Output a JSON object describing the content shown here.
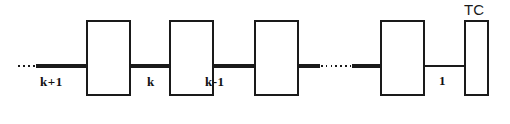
{
  "figure": {
    "type": "chain-block-diagram",
    "width": 510,
    "height": 124,
    "background": "#ffffff",
    "stroke_color": "#1a1a1a",
    "labels": {
      "k_plus_1": "k+1",
      "k": "k",
      "k_minus_1": "k-1",
      "one": "1",
      "tc": "TC"
    },
    "blocks": [
      {
        "id": "block-k-plus-1",
        "x": 87,
        "y": 21,
        "width": 43,
        "height": 74
      },
      {
        "id": "block-k",
        "x": 170,
        "y": 21,
        "width": 43,
        "height": 74
      },
      {
        "id": "block-k-minus-1",
        "x": 255,
        "y": 21,
        "width": 43,
        "height": 74
      },
      {
        "id": "block-one",
        "x": 381,
        "y": 21,
        "width": 43,
        "height": 74
      },
      {
        "id": "block-tc",
        "x": 465,
        "y": 21,
        "width": 23,
        "height": 74
      }
    ],
    "connectors": [
      {
        "id": "lead-in-dots",
        "style": "dotted",
        "x1": 18,
        "x2": 38,
        "y": 66
      },
      {
        "id": "lead-in-solid",
        "style": "solid",
        "x1": 36,
        "x2": 87,
        "y": 66
      },
      {
        "id": "link-kp1-k",
        "style": "solid",
        "x1": 130,
        "x2": 170,
        "y": 66
      },
      {
        "id": "link-k-km1",
        "style": "solid",
        "x1": 213,
        "x2": 255,
        "y": 66
      },
      {
        "id": "link-km1-gap-a",
        "style": "solid",
        "x1": 298,
        "x2": 319,
        "y": 66
      },
      {
        "id": "link-ellipsis",
        "style": "dotted",
        "x1": 320,
        "x2": 353,
        "y": 66
      },
      {
        "id": "link-gap-one",
        "style": "solid",
        "x1": 352,
        "x2": 381,
        "y": 66
      },
      {
        "id": "link-one-tc",
        "style": "solid",
        "x1": 424,
        "x2": 466,
        "y": 66
      }
    ]
  }
}
